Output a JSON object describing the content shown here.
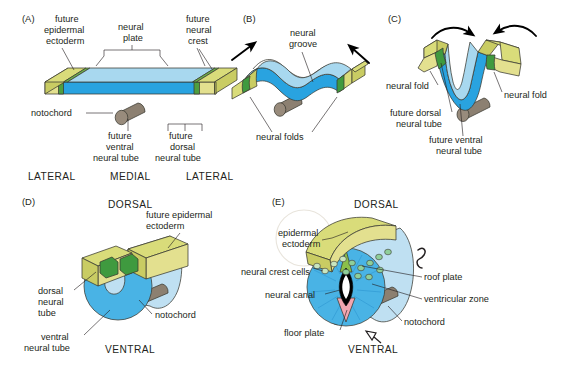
{
  "figure": {
    "background": "#ffffff"
  },
  "palette": {
    "epidermal_ectoderm_top": "#d9dc7a",
    "epidermal_ectoderm_face": "#e3e08f",
    "epidermal_ectoderm_side": "#c9cc63",
    "neural_plate_top": "#a8d8ef",
    "neural_plate_face": "#29a3e0",
    "neural_plate_mid": "#6ec4ea",
    "neural_crest_green": "#3f9a3f",
    "neural_crest_green_light": "#6fb24a",
    "notochord_brown": "#8c8071",
    "floor_plate_pink": "#f2a6b0",
    "neural_canal_outline": "#000000",
    "neural_canal_fill": "#ffffff",
    "text": "#231f20",
    "leader_line": "#231f20"
  },
  "panels": [
    {
      "id": "A",
      "letter": "(A)",
      "labels": [
        {
          "name": "future-epidermal-ectoderm",
          "lines": [
            "future",
            "epidermal",
            "ectoderm"
          ]
        },
        {
          "name": "neural-plate",
          "lines": [
            "neural",
            "plate"
          ]
        },
        {
          "name": "future-neural-crest",
          "lines": [
            "future",
            "neural",
            "crest"
          ]
        },
        {
          "name": "notochord",
          "lines": [
            "notochord"
          ]
        },
        {
          "name": "future-ventral-neural-tube",
          "lines": [
            "future",
            "ventral",
            "neural tube"
          ]
        },
        {
          "name": "future-dorsal-neural-tube",
          "lines": [
            "future",
            "dorsal",
            "neural tube"
          ]
        }
      ],
      "axis_labels": [
        "LATERAL",
        "MEDIAL",
        "LATERAL"
      ]
    },
    {
      "id": "B",
      "letter": "(B)",
      "labels": [
        {
          "name": "neural-groove",
          "lines": [
            "neural",
            "groove"
          ]
        },
        {
          "name": "neural-folds",
          "lines": [
            "neural folds"
          ]
        }
      ],
      "arrows": 2,
      "arrow_style": "straight"
    },
    {
      "id": "C",
      "letter": "(C)",
      "labels": [
        {
          "name": "neural-fold-left",
          "lines": [
            "neural fold"
          ]
        },
        {
          "name": "neural-fold-right",
          "lines": [
            "neural fold"
          ]
        },
        {
          "name": "future-dorsal-neural-tube",
          "lines": [
            "future dorsal",
            "neural tube"
          ]
        },
        {
          "name": "future-ventral-neural-tube",
          "lines": [
            "future ventral",
            "neural tube"
          ]
        }
      ],
      "arrows": 2,
      "arrow_style": "curved"
    },
    {
      "id": "D",
      "letter": "(D)",
      "labels": [
        {
          "name": "dorsal-orientation",
          "lines": [
            "DORSAL"
          ]
        },
        {
          "name": "future-epidermal-ectoderm",
          "lines": [
            "future epidermal",
            "ectoderm"
          ]
        },
        {
          "name": "dorsal-neural-tube",
          "lines": [
            "dorsal",
            "neural",
            "tube"
          ]
        },
        {
          "name": "ventral-neural-tube",
          "lines": [
            "ventral",
            "neural tube"
          ]
        },
        {
          "name": "notochord",
          "lines": [
            "notochord"
          ]
        },
        {
          "name": "ventral-orientation",
          "lines": [
            "VENTRAL"
          ]
        }
      ]
    },
    {
      "id": "E",
      "letter": "(E)",
      "labels": [
        {
          "name": "dorsal-orientation",
          "lines": [
            "DORSAL"
          ]
        },
        {
          "name": "epidermal-ectoderm",
          "lines": [
            "epidermal",
            "ectoderm"
          ]
        },
        {
          "name": "neural-crest-cells",
          "lines": [
            "neural crest cells"
          ]
        },
        {
          "name": "neural-canal",
          "lines": [
            "neural canal"
          ]
        },
        {
          "name": "floor-plate",
          "lines": [
            "floor plate"
          ]
        },
        {
          "name": "roof-plate",
          "lines": [
            "roof plate"
          ]
        },
        {
          "name": "ventricular-zone",
          "lines": [
            "ventricular zone"
          ]
        },
        {
          "name": "notochord",
          "lines": [
            "notochord"
          ]
        },
        {
          "name": "ventral-orientation",
          "lines": [
            "VENTRAL"
          ]
        }
      ]
    }
  ],
  "text": {
    "A_letter": "(A)",
    "A_future": "future",
    "A_epidermal": "epidermal",
    "A_ectoderm": "ectoderm",
    "A_neural": "neural",
    "A_plate": "plate",
    "A_future2": "future",
    "A_neural2": "neural",
    "A_crest": "crest",
    "A_notochord": "notochord",
    "A_future3": "future",
    "A_ventral": "ventral",
    "A_nt1": "neural tube",
    "A_future4": "future",
    "A_dorsal": "dorsal",
    "A_nt2": "neural tube",
    "A_lateral1": "LATERAL",
    "A_medial": "MEDIAL",
    "A_lateral2": "LATERAL",
    "B_letter": "(B)",
    "B_neural": "neural",
    "B_groove": "groove",
    "B_folds": "neural folds",
    "C_letter": "(C)",
    "C_fold_left": "neural fold",
    "C_fold_right": "neural fold",
    "C_fd1": "future dorsal",
    "C_fd2": "neural tube",
    "C_fv1": "future ventral",
    "C_fv2": "neural tube",
    "D_letter": "(D)",
    "D_dorsal": "DORSAL",
    "D_fee1": "future epidermal",
    "D_fee2": "ectoderm",
    "D_dnt1": "dorsal",
    "D_dnt2": "neural",
    "D_dnt3": "tube",
    "D_vnt1": "ventral",
    "D_vnt2": "neural tube",
    "D_notochord": "notochord",
    "D_ventral": "VENTRAL",
    "E_letter": "(E)",
    "E_dorsal": "DORSAL",
    "E_ee1": "epidermal",
    "E_ee2": "ectoderm",
    "E_crest": "neural crest cells",
    "E_canal": "neural canal",
    "E_floor": "floor plate",
    "E_roof": "roof plate",
    "E_vent": "ventricular zone",
    "E_notochord": "notochord",
    "E_ventral": "VENTRAL"
  }
}
